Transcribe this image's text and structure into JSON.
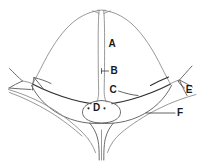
{
  "figure": {
    "background_color": "#ffffff",
    "width": 203,
    "height": 161,
    "line_colors": {
      "thin_outline": "#8d8d8d",
      "mid_outline": "#6b6b6b",
      "dark_outline": "#303030",
      "leader": "#3a3a3a",
      "label_text": "#1a1a1a"
    }
  },
  "labels": [
    {
      "id": "A",
      "text": "A",
      "x": 112,
      "y": 44,
      "has_leader": false
    },
    {
      "id": "B",
      "text": "B",
      "x": 114,
      "y": 71,
      "has_leader": true
    },
    {
      "id": "C",
      "text": "C",
      "x": 113,
      "y": 90,
      "has_leader": true
    },
    {
      "id": "D",
      "text": "D",
      "x": 96,
      "y": 108,
      "has_leader": false
    },
    {
      "id": "E",
      "text": "E",
      "x": 189,
      "y": 90,
      "has_leader": true
    },
    {
      "id": "F",
      "text": "F",
      "x": 180,
      "y": 113,
      "has_leader": true
    }
  ]
}
